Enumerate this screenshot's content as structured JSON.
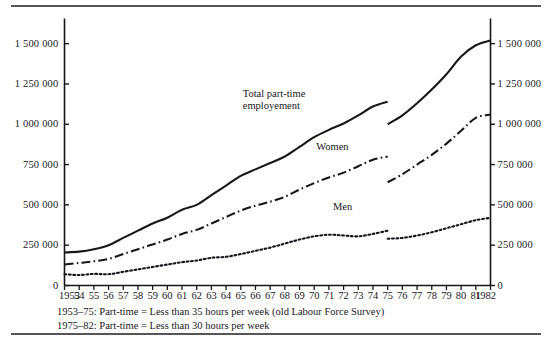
{
  "figure": {
    "has_top_rule": true,
    "has_bottom_rule": true,
    "ink_color": "#17171a",
    "rule_color": "#55555a"
  },
  "labels": {
    "total_line1": "Total part-time",
    "total_line2": "employement",
    "women": "Women",
    "men": "Men"
  },
  "footnotes": {
    "line1": "1953–75: Part-time  =  Less than 35 hours per week (old Labour Force Survey)",
    "line2": "1975–82: Part-time  =  Less than 30 hours per week"
  },
  "chart_data": {
    "type": "line",
    "title": "",
    "xlabel": "",
    "ylabel": "",
    "xlim": [
      1953,
      1982
    ],
    "ylim": [
      0,
      1600000
    ],
    "grid": false,
    "legend": "inline-annotations",
    "yticks": [
      0,
      250000,
      500000,
      750000,
      1000000,
      1250000,
      1500000
    ],
    "ytick_labels": [
      "0",
      "250 000",
      "500 000",
      "750 000",
      "1 000 000",
      "1 250 000",
      "1 500 000"
    ],
    "ytick_labels_right": [
      "0",
      "250 000",
      "500 000",
      "750 000",
      "1 000 000",
      "1 250 000",
      "1 500 000"
    ],
    "x": [
      1953,
      1954,
      1955,
      1956,
      1957,
      1958,
      1959,
      1960,
      1961,
      1962,
      1963,
      1964,
      1965,
      1966,
      1967,
      1968,
      1969,
      1970,
      1971,
      1972,
      1973,
      1974,
      1975,
      1976,
      1977,
      1978,
      1979,
      1980,
      1981,
      1982
    ],
    "xtick_labels": [
      "1953",
      "54",
      "55",
      "56",
      "57",
      "58",
      "59",
      "60",
      "61",
      "62",
      "63",
      "64",
      "65",
      "66",
      "67",
      "68",
      "69",
      "70",
      "71",
      "72",
      "73",
      "74",
      "75",
      "76",
      "77",
      "78",
      "79",
      "80",
      "81",
      "1982"
    ],
    "break_year": 1975,
    "break_note": "series discontinuous at 1975 due to definition change",
    "series": [
      {
        "name": "Total part-time employement",
        "style": "solid",
        "segment_old": {
          "x": [
            1953,
            1954,
            1955,
            1956,
            1957,
            1958,
            1959,
            1960,
            1961,
            1962,
            1963,
            1964,
            1965,
            1966,
            1967,
            1968,
            1969,
            1970,
            1971,
            1972,
            1973,
            1974,
            1975
          ],
          "values": [
            205000,
            210000,
            225000,
            250000,
            295000,
            340000,
            385000,
            420000,
            470000,
            500000,
            560000,
            620000,
            680000,
            720000,
            760000,
            800000,
            860000,
            920000,
            965000,
            1005000,
            1055000,
            1110000,
            1140000
          ]
        },
        "segment_new": {
          "x": [
            1975,
            1976,
            1977,
            1978,
            1979,
            1980,
            1981,
            1982
          ],
          "values": [
            1000000,
            1055000,
            1130000,
            1215000,
            1310000,
            1420000,
            1490000,
            1520000
          ]
        }
      },
      {
        "name": "Women",
        "style": "dash-dot",
        "segment_old": {
          "x": [
            1953,
            1954,
            1955,
            1956,
            1957,
            1958,
            1959,
            1960,
            1961,
            1962,
            1963,
            1964,
            1965,
            1966,
            1967,
            1968,
            1969,
            1970,
            1971,
            1972,
            1973,
            1974,
            1975
          ],
          "values": [
            130000,
            140000,
            150000,
            165000,
            195000,
            225000,
            255000,
            285000,
            320000,
            345000,
            385000,
            425000,
            465000,
            495000,
            520000,
            550000,
            595000,
            635000,
            670000,
            700000,
            740000,
            780000,
            800000
          ]
        },
        "segment_new": {
          "x": [
            1975,
            1976,
            1977,
            1978,
            1979,
            1980,
            1981,
            1982
          ],
          "values": [
            640000,
            690000,
            750000,
            810000,
            880000,
            960000,
            1040000,
            1060000
          ]
        }
      },
      {
        "name": "Men",
        "style": "dotted",
        "segment_old": {
          "x": [
            1953,
            1954,
            1955,
            1956,
            1957,
            1958,
            1959,
            1960,
            1961,
            1962,
            1963,
            1964,
            1965,
            1966,
            1967,
            1968,
            1969,
            1970,
            1971,
            1972,
            1973,
            1974,
            1975
          ],
          "values": [
            70000,
            65000,
            72000,
            70000,
            85000,
            100000,
            115000,
            130000,
            145000,
            155000,
            172000,
            178000,
            195000,
            215000,
            235000,
            260000,
            285000,
            305000,
            315000,
            310000,
            305000,
            320000,
            340000
          ]
        },
        "segment_new": {
          "x": [
            1975,
            1976,
            1977,
            1978,
            1979,
            1980,
            1981,
            1982
          ],
          "values": [
            290000,
            295000,
            310000,
            330000,
            355000,
            380000,
            405000,
            420000
          ]
        }
      }
    ]
  }
}
